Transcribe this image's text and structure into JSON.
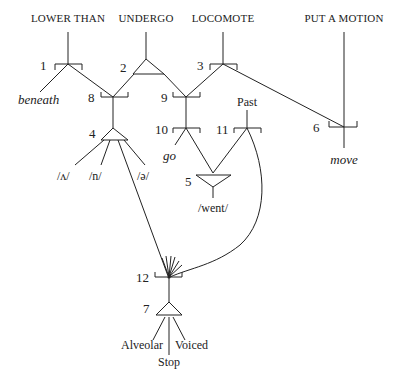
{
  "top_labels": {
    "lower_than": "LOWER THAN",
    "undergo": "UNDERGO",
    "locomote": "LOCOMOTE",
    "put_a_motion": "PUT A MOTION",
    "past": "Past"
  },
  "lexical_labels": {
    "beneath": "beneath",
    "go": "go",
    "move": "move"
  },
  "phonemic_labels": {
    "wedge": "/ʌ/",
    "n": "/n/",
    "schwa": "/ə/",
    "went": "/went/"
  },
  "feature_labels": {
    "alveolar": "Alveolar",
    "stop": "Stop",
    "voiced": "Voiced"
  },
  "nodes": {
    "n1": "1",
    "n2": "2",
    "n3": "3",
    "n4": "4",
    "n5": "5",
    "n6": "6",
    "n7": "7",
    "n8": "8",
    "n9": "9",
    "n10": "10",
    "n11": "11",
    "n12": "12"
  }
}
